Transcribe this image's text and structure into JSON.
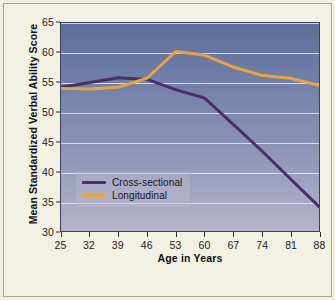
{
  "figure": {
    "background_color": "#f2efe2",
    "frame_color": "#a8a49a",
    "plot_bg_top": "#5d6d99",
    "plot_bg_bottom": "#b6b3ca"
  },
  "chart_data": {
    "type": "line",
    "title": "",
    "xlabel": "Age in Years",
    "ylabel": "Mean Standardized Verbal Ability Score",
    "x": [
      25,
      32,
      39,
      46,
      53,
      60,
      67,
      74,
      81,
      88
    ],
    "xticklabels": [
      "25",
      "32",
      "39",
      "46",
      "53",
      "60",
      "67",
      "74",
      "81",
      "88"
    ],
    "yticklabels": [
      "30",
      "35",
      "40",
      "45",
      "50",
      "55",
      "60",
      "65"
    ],
    "yticks": [
      30,
      35,
      40,
      45,
      50,
      55,
      60,
      65
    ],
    "xlim": [
      25,
      88
    ],
    "ylim": [
      30,
      65
    ],
    "grid": "horizontal",
    "legend_position": "lower-left-inside",
    "series": [
      {
        "name": "Cross-sectional",
        "color": "#4a2d6b",
        "values": [
          54.2,
          55.0,
          55.8,
          55.5,
          53.8,
          52.4,
          48.0,
          43.5,
          38.8,
          34.1
        ]
      },
      {
        "name": "Longitudinal",
        "color": "#e8a33d",
        "values": [
          54.0,
          53.9,
          54.2,
          55.7,
          60.2,
          59.6,
          57.6,
          56.2,
          55.7,
          54.5
        ]
      }
    ]
  },
  "legend": {
    "items": [
      {
        "label": "Cross-sectional",
        "color": "#4a2d6b"
      },
      {
        "label": "Longitudinal",
        "color": "#e8a33d"
      }
    ]
  }
}
